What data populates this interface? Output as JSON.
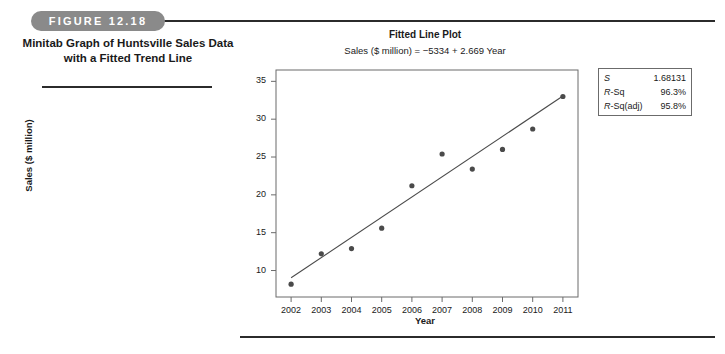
{
  "figure": {
    "label": "FIGURE 12.18",
    "caption": "Minitab Graph of Huntsville Sales Data with a Fitted Trend Line"
  },
  "stats": {
    "rows": [
      {
        "key": "S",
        "key_italic": "S",
        "key_rest": "",
        "value": "1.68131"
      },
      {
        "key": "R-Sq",
        "key_italic": "R",
        "key_rest": "-Sq",
        "value": "96.3%"
      },
      {
        "key": "R-Sq(adj)",
        "key_italic": "R",
        "key_rest": "-Sq(adj)",
        "value": "95.8%"
      }
    ]
  },
  "chart_data": {
    "type": "scatter",
    "title": "Fitted Line Plot",
    "subtitle": "Sales ($ million) = −5334 + 2.669 Year",
    "xlabel": "Year",
    "ylabel": "Sales ($ million)",
    "x": [
      2002,
      2003,
      2004,
      2005,
      2006,
      2007,
      2008,
      2009,
      2010,
      2011
    ],
    "values": [
      8.2,
      12.2,
      12.9,
      15.6,
      21.2,
      25.4,
      23.4,
      26.0,
      28.7,
      33.0
    ],
    "xtick_labels": [
      "2002",
      "2003",
      "2004",
      "2005",
      "2006",
      "2007",
      "2008",
      "2009",
      "2010",
      "2011"
    ],
    "ytick_labels": [
      "10",
      "15",
      "20",
      "25",
      "30",
      "35"
    ],
    "ytick_values": [
      10,
      15,
      20,
      25,
      30,
      35
    ],
    "xlim": [
      2001.5,
      2011.5
    ],
    "ylim": [
      6.5,
      36.5
    ],
    "grid": false,
    "legend": false,
    "fit_line": {
      "label": "fitted trend line",
      "intercept": -5334,
      "slope": 2.669,
      "x_start": 2002,
      "x_end": 2011,
      "y_start": 9.038,
      "y_end": 33.059
    },
    "marker_color": "#4a4a4a",
    "line_color": "#4a4a4a",
    "frame_color": "#6b6b6b"
  }
}
